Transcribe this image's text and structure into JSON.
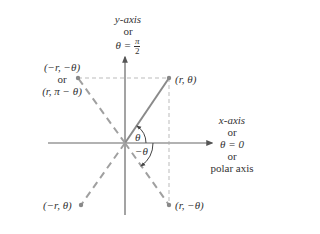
{
  "diagram": {
    "type": "polar-coordinate-symmetry",
    "y_axis_label": {
      "line1": "y-axis",
      "line2": "or",
      "line3_prefix": "θ =",
      "line3_num": "π",
      "line3_den": "2"
    },
    "x_axis_label": {
      "line1": "x-axis",
      "line2": "or",
      "line3": "θ = 0",
      "line4": "or",
      "line5": "polar axis"
    },
    "points": {
      "q1": "(r, θ)",
      "q2_line1": "(−r, −θ)",
      "q2_line2": "or",
      "q2_line3": "(r, π − θ)",
      "q3": "(−r, θ)",
      "q4": "(r, −θ)"
    },
    "angles": {
      "positive": "θ",
      "negative": "−θ"
    },
    "colors": {
      "solid_line": "#8a8a8a",
      "dashed_line": "#a0a0a0",
      "axis": "#666666",
      "text": "#333333"
    }
  }
}
